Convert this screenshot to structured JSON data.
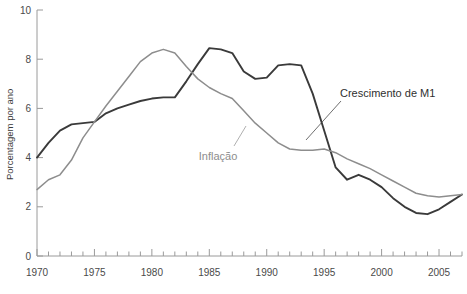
{
  "chart_data": {
    "type": "line",
    "title": "",
    "xlabel": "",
    "ylabel": "Porcentagem por ano",
    "xlim": [
      1970,
      2007
    ],
    "ylim": [
      0,
      10
    ],
    "grid": false,
    "legend_position": "inline-annotations",
    "x_ticks_major": [
      1970,
      1975,
      1980,
      1985,
      1990,
      1995,
      2000,
      2005
    ],
    "x_tick_labels": [
      "1970",
      "1975",
      "1980",
      "1985",
      "1990",
      "1995",
      "2000",
      "2005"
    ],
    "x_tick_interval_minor": 1,
    "y_ticks": [
      0,
      2,
      4,
      6,
      8,
      10
    ],
    "y_tick_labels": [
      "0",
      "2",
      "4",
      "6",
      "8",
      "10"
    ],
    "x": [
      1970,
      1971,
      1972,
      1973,
      1974,
      1975,
      1976,
      1977,
      1978,
      1979,
      1980,
      1981,
      1982,
      1983,
      1984,
      1985,
      1986,
      1987,
      1988,
      1989,
      1990,
      1991,
      1992,
      1993,
      1994,
      1995,
      1996,
      1997,
      1998,
      1999,
      2000,
      2001,
      2002,
      2003,
      2004,
      2005,
      2006,
      2007
    ],
    "series": [
      {
        "name": "Crescimento de M1",
        "color": "#3a3a3a",
        "label_text": "Crescimento de M1",
        "values": [
          4.0,
          4.6,
          5.1,
          5.35,
          5.4,
          5.45,
          5.8,
          6.0,
          6.15,
          6.3,
          6.4,
          6.45,
          6.45,
          7.1,
          7.8,
          8.45,
          8.4,
          8.25,
          7.5,
          7.2,
          7.25,
          7.75,
          7.8,
          7.75,
          6.6,
          5.1,
          3.6,
          3.1,
          3.3,
          3.1,
          2.8,
          2.35,
          2.0,
          1.75,
          1.7,
          1.9,
          2.2,
          2.5
        ]
      },
      {
        "name": "Inflação",
        "color": "#8d8d8d",
        "label_text": "Inflação",
        "values": [
          2.7,
          3.1,
          3.3,
          3.9,
          4.8,
          5.45,
          6.1,
          6.7,
          7.3,
          7.9,
          8.25,
          8.4,
          8.25,
          7.7,
          7.2,
          6.85,
          6.6,
          6.4,
          5.9,
          5.4,
          5.0,
          4.6,
          4.35,
          4.3,
          4.3,
          4.35,
          4.2,
          3.95,
          3.75,
          3.55,
          3.3,
          3.05,
          2.8,
          2.55,
          2.45,
          2.4,
          2.45,
          2.5
        ]
      }
    ],
    "annotations": [
      {
        "text": "Crescimento de M1",
        "anchor_year": 1996.2,
        "anchor_value": 4.6
      },
      {
        "text": "Inflação",
        "anchor_year": 1991.5,
        "anchor_value": 4.6
      }
    ]
  }
}
